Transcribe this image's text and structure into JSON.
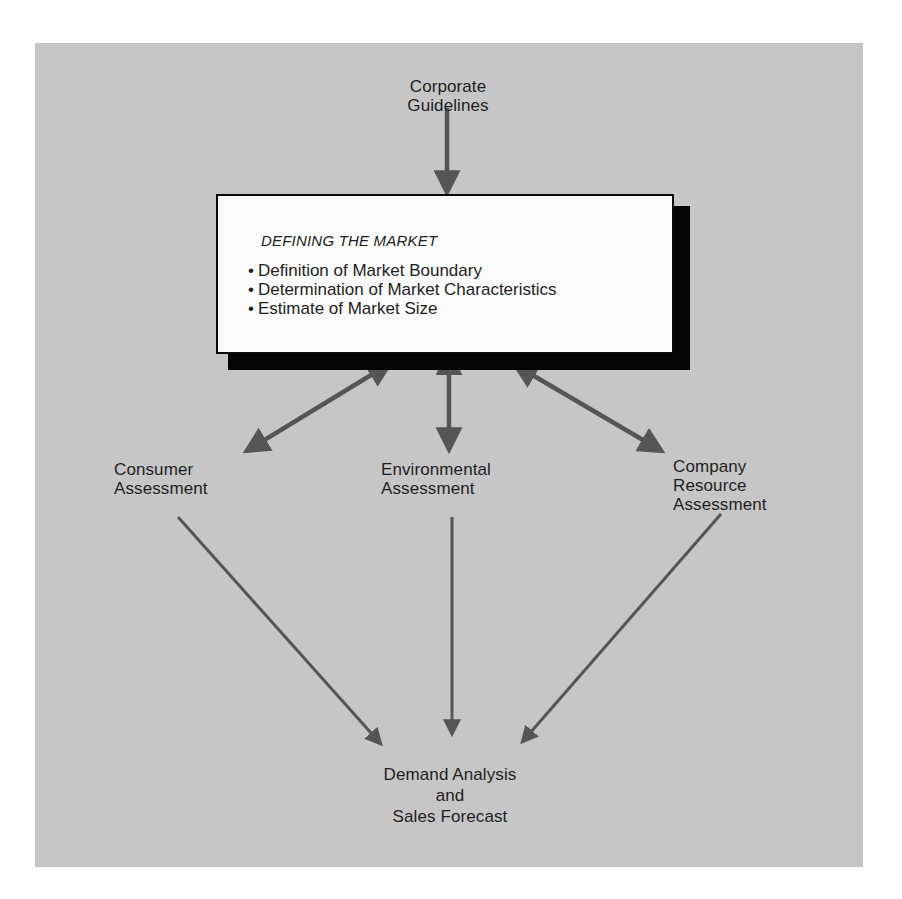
{
  "diagram": {
    "type": "flow",
    "colors": {
      "background": "#ffffff",
      "panel": "#c6c6c6",
      "arrow": "#555555",
      "box_fill": "#fbfbfb",
      "box_border": "#0a0a0a",
      "box_shadow": "#050505",
      "text": "#1e1e1e"
    },
    "nodes": {
      "corporate_guidelines": {
        "line1": "Corporate",
        "line2": "Guidelines"
      },
      "defining_market": {
        "title": "DEFINING THE MARKET",
        "items": [
          "Definition of Market Boundary",
          "Determination of Market Characteristics",
          "Estimate of Market Size"
        ]
      },
      "consumer_assessment": {
        "line1": "Consumer",
        "line2": "Assessment"
      },
      "environmental_assessment": {
        "line1": "Environmental",
        "line2": "Assessment"
      },
      "company_resource_assessment": {
        "line1": "Company",
        "line2": "Resource",
        "line3": "Assessment"
      },
      "demand_analysis": {
        "line1": "Demand Analysis",
        "line2": "and",
        "line3": "Sales Forecast"
      }
    },
    "edges": [
      {
        "from": "Corporate Guidelines",
        "to": "Defining the Market",
        "direction": "one-way"
      },
      {
        "from": "Defining the Market",
        "to": "Consumer Assessment",
        "direction": "two-way"
      },
      {
        "from": "Defining the Market",
        "to": "Environmental Assessment",
        "direction": "two-way"
      },
      {
        "from": "Defining the Market",
        "to": "Company Resource Assessment",
        "direction": "two-way"
      },
      {
        "from": "Consumer Assessment",
        "to": "Demand Analysis and Sales Forecast",
        "direction": "one-way"
      },
      {
        "from": "Environmental Assessment",
        "to": "Demand Analysis and Sales Forecast",
        "direction": "one-way"
      },
      {
        "from": "Company Resource Assessment",
        "to": "Demand Analysis and Sales Forecast",
        "direction": "one-way"
      }
    ]
  }
}
